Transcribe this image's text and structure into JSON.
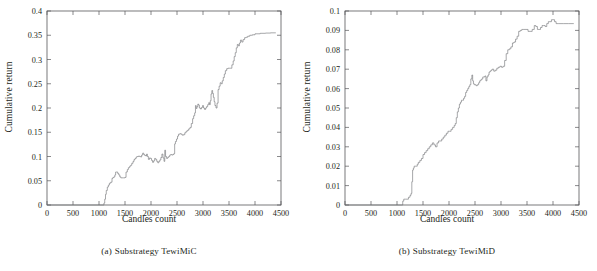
{
  "figure": {
    "panels": [
      {
        "id": "panel-a",
        "caption_label": "(a)",
        "caption_text": "Substrategy TewiMiC",
        "chart_data": {
          "type": "line",
          "title": "",
          "subtitle": "",
          "xlabel": "Candles count",
          "ylabel": "Cumulative return",
          "xlim": [
            0,
            4500
          ],
          "ylim": [
            0,
            0.4
          ],
          "xticks": [
            0,
            500,
            1000,
            1500,
            2000,
            2500,
            3000,
            3500,
            4000,
            4500
          ],
          "xticklabels": [
            "0",
            "500",
            "1000",
            "1500",
            "2000",
            "2500",
            "3000",
            "3500",
            "4000",
            "4500"
          ],
          "yticks": [
            0,
            0.05,
            0.1,
            0.15,
            0.2,
            0.25,
            0.3,
            0.35,
            0.4
          ],
          "yticklabels": [
            "0",
            "0.05",
            "0.1",
            "0.15",
            "0.2",
            "0.25",
            "0.3",
            "0.35",
            "0.4"
          ],
          "grid": false,
          "legend": "none",
          "line_color": "#77787b",
          "series": [
            {
              "name": "Cumulative return",
              "step": "post",
              "x": [
                0,
                1080,
                1095,
                1110,
                1125,
                1140,
                1160,
                1180,
                1200,
                1225,
                1250,
                1270,
                1290,
                1305,
                1320,
                1340,
                1360,
                1380,
                1400,
                1420,
                1440,
                1470,
                1500,
                1520,
                1545,
                1565,
                1590,
                1610,
                1630,
                1655,
                1675,
                1695,
                1715,
                1735,
                1760,
                1780,
                1800,
                1820,
                1840,
                1860,
                1880,
                1900,
                1915,
                1930,
                1950,
                1970,
                1990,
                2010,
                2030,
                2050,
                2070,
                2090,
                2110,
                2130,
                2150,
                2170,
                2190,
                2210,
                2230,
                2250,
                2265,
                2280,
                2300,
                2320,
                2340,
                2360,
                2380,
                2400,
                2420,
                2440,
                2455,
                2470,
                2490,
                2510,
                2530,
                2555,
                2580,
                2600,
                2625,
                2650,
                2675,
                2700,
                2725,
                2750,
                2775,
                2800,
                2820,
                2840,
                2855,
                2870,
                2885,
                2900,
                2915,
                2930,
                2950,
                2970,
                2990,
                3010,
                3030,
                3050,
                3070,
                3090,
                3110,
                3125,
                3140,
                3155,
                3170,
                3185,
                3200,
                3215,
                3230,
                3250,
                3270,
                3290,
                3310,
                3330,
                3350,
                3370,
                3390,
                3410,
                3430,
                3455,
                3480,
                3505,
                3530,
                3555,
                3580,
                3600,
                3620,
                3640,
                3660,
                3680,
                3700,
                3720,
                3745,
                3770,
                3800,
                3830,
                3860,
                3900,
                3950,
                4000,
                4100,
                4200,
                4300,
                4400
              ],
              "y": [
                0,
                0.0,
                0.004,
                0.012,
                0.022,
                0.03,
                0.037,
                0.041,
                0.045,
                0.047,
                0.055,
                0.057,
                0.058,
                0.062,
                0.068,
                0.068,
                0.065,
                0.062,
                0.058,
                0.056,
                0.056,
                0.056,
                0.057,
                0.068,
                0.073,
                0.077,
                0.08,
                0.082,
                0.086,
                0.09,
                0.094,
                0.096,
                0.099,
                0.1,
                0.101,
                0.1,
                0.099,
                0.103,
                0.107,
                0.104,
                0.102,
                0.101,
                0.105,
                0.1,
                0.094,
                0.097,
                0.096,
                0.092,
                0.088,
                0.091,
                0.096,
                0.094,
                0.09,
                0.087,
                0.09,
                0.093,
                0.098,
                0.105,
                0.097,
                0.09,
                0.113,
                0.1,
                0.096,
                0.098,
                0.1,
                0.103,
                0.104,
                0.103,
                0.104,
                0.106,
                0.126,
                0.131,
                0.136,
                0.142,
                0.146,
                0.147,
                0.146,
                0.144,
                0.145,
                0.149,
                0.152,
                0.154,
                0.157,
                0.16,
                0.168,
                0.178,
                0.184,
                0.19,
                0.205,
                0.199,
                0.203,
                0.208,
                0.206,
                0.2,
                0.198,
                0.201,
                0.205,
                0.2,
                0.197,
                0.2,
                0.203,
                0.207,
                0.211,
                0.207,
                0.215,
                0.229,
                0.236,
                0.23,
                0.222,
                0.213,
                0.205,
                0.2,
                0.21,
                0.238,
                0.245,
                0.252,
                0.25,
                0.256,
                0.263,
                0.27,
                0.277,
                0.281,
                0.282,
                0.282,
                0.282,
                0.289,
                0.297,
                0.306,
                0.314,
                0.324,
                0.331,
                0.328,
                0.334,
                0.34,
                0.336,
                0.341,
                0.345,
                0.346,
                0.348,
                0.35,
                0.351,
                0.353,
                0.354,
                0.3545,
                0.355,
                0.355,
                0.355,
                0.355,
                0.355
              ]
            }
          ]
        }
      },
      {
        "id": "panel-b",
        "caption_label": "(b)",
        "caption_text": "Substrategy TewiMiD",
        "chart_data": {
          "type": "line",
          "title": "",
          "subtitle": "",
          "xlabel": "Candles count",
          "ylabel": "Cumulative return",
          "xlim": [
            0,
            4500
          ],
          "ylim": [
            0,
            0.1
          ],
          "xticks": [
            0,
            500,
            1000,
            1500,
            2000,
            2500,
            3000,
            3500,
            4000,
            4500
          ],
          "xticklabels": [
            "0",
            "500",
            "1000",
            "1500",
            "2000",
            "2500",
            "3000",
            "3500",
            "4000",
            "4500"
          ],
          "yticks": [
            0,
            0.01,
            0.02,
            0.03,
            0.04,
            0.05,
            0.06,
            0.07,
            0.08,
            0.09,
            0.1
          ],
          "yticklabels": [
            "0",
            "0.01",
            "0.02",
            "0.03",
            "0.04",
            "0.05",
            "0.06",
            "0.07",
            "0.08",
            "0.09",
            "0.1"
          ],
          "grid": false,
          "legend": "none",
          "line_color": "#77787b",
          "series": [
            {
              "name": "Cumulative return",
              "step": "post",
              "x": [
                0,
                1090,
                1110,
                1130,
                1160,
                1190,
                1220,
                1250,
                1270,
                1285,
                1300,
                1315,
                1330,
                1350,
                1370,
                1390,
                1410,
                1440,
                1470,
                1500,
                1530,
                1560,
                1590,
                1620,
                1650,
                1680,
                1710,
                1740,
                1770,
                1800,
                1830,
                1860,
                1890,
                1920,
                1950,
                1980,
                2010,
                2040,
                2070,
                2100,
                2120,
                2140,
                2160,
                2180,
                2200,
                2220,
                2240,
                2260,
                2280,
                2300,
                2320,
                2340,
                2360,
                2380,
                2400,
                2420,
                2440,
                2455,
                2470,
                2485,
                2500,
                2520,
                2545,
                2570,
                2590,
                2610,
                2630,
                2650,
                2670,
                2690,
                2710,
                2730,
                2750,
                2770,
                2790,
                2810,
                2830,
                2860,
                2890,
                2920,
                2950,
                2980,
                3010,
                3040,
                3070,
                3100,
                3130,
                3160,
                3190,
                3220,
                3250,
                3280,
                3310,
                3340,
                3370,
                3400,
                3440,
                3480,
                3520,
                3560,
                3600,
                3640,
                3670,
                3700,
                3730,
                3760,
                3790,
                3820,
                3850,
                3880,
                3910,
                3940,
                3970,
                4000,
                4030,
                4060,
                4100,
                4200,
                4300,
                4400
              ],
              "y": [
                0,
                0.0,
                0.002,
                0.003,
                0.003,
                0.003,
                0.004,
                0.005,
                0.006,
                0.012,
                0.018,
                0.019,
                0.02,
                0.02,
                0.02,
                0.021,
                0.022,
                0.023,
                0.024,
                0.026,
                0.027,
                0.028,
                0.029,
                0.03,
                0.031,
                0.032,
                0.031,
                0.03,
                0.032,
                0.033,
                0.033,
                0.034,
                0.035,
                0.036,
                0.037,
                0.038,
                0.038,
                0.039,
                0.04,
                0.041,
                0.042,
                0.045,
                0.048,
                0.05,
                0.052,
                0.053,
                0.054,
                0.054,
                0.055,
                0.056,
                0.058,
                0.059,
                0.06,
                0.061,
                0.062,
                0.065,
                0.067,
                0.064,
                0.0625,
                0.062,
                0.062,
                0.0615,
                0.062,
                0.063,
                0.064,
                0.0645,
                0.065,
                0.066,
                0.066,
                0.0665,
                0.064,
                0.066,
                0.067,
                0.0685,
                0.069,
                0.0695,
                0.07,
                0.069,
                0.0695,
                0.0705,
                0.071,
                0.0715,
                0.071,
                0.0715,
                0.0745,
                0.078,
                0.08,
                0.0805,
                0.0815,
                0.0835,
                0.084,
                0.0855,
                0.087,
                0.0895,
                0.09,
                0.0905,
                0.0905,
                0.0905,
                0.0895,
                0.0895,
                0.0905,
                0.0925,
                0.092,
                0.0905,
                0.0905,
                0.0915,
                0.0925,
                0.0925,
                0.092,
                0.0935,
                0.0945,
                0.0945,
                0.0955,
                0.0955,
                0.0945,
                0.0935,
                0.0935,
                0.0935,
                0.0935,
                0.0935
              ]
            }
          ]
        }
      }
    ]
  }
}
